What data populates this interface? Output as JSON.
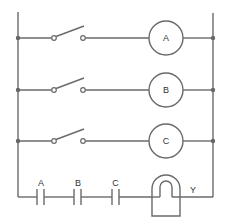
{
  "diagram": {
    "type": "ladder-logic-circuit",
    "rungs": [
      {
        "switch": "normally-open",
        "output": "lamp",
        "label": "A"
      },
      {
        "switch": "normally-open",
        "output": "lamp",
        "label": "B"
      },
      {
        "switch": "normally-open",
        "output": "lamp",
        "label": "C"
      }
    ],
    "contacts": [
      {
        "label": "A"
      },
      {
        "label": "B"
      },
      {
        "label": "C"
      }
    ],
    "coil": {
      "label": "Y"
    }
  }
}
